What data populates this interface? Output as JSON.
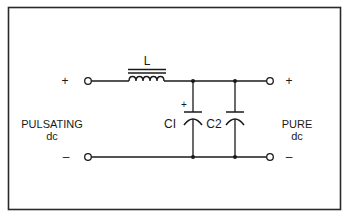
{
  "diagram": {
    "colors": {
      "ink": "#1a1a1a",
      "background": "#ffffff",
      "frame": "#2a2a2a"
    },
    "input": {
      "label_line1": "PULSATING",
      "label_line2": "dc",
      "plus": "+",
      "minus": "–"
    },
    "output": {
      "label_line1": "PURE",
      "label_line2": "dc",
      "plus": "+",
      "minus": "–"
    },
    "components": {
      "inductor": {
        "label": "L"
      },
      "c1": {
        "label": "CI",
        "polarity": "+"
      },
      "c2": {
        "label": "C2"
      }
    }
  }
}
